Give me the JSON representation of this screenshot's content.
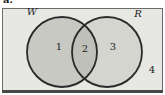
{
  "figure": {
    "list_marker": "a.",
    "venn": {
      "left_set_label": "W",
      "right_set_label": "R",
      "regions": {
        "left_only": "1",
        "intersection": "2",
        "right_only": "3",
        "outside": "4"
      }
    },
    "colors": {
      "frame_fill": "#e7e7e3",
      "frame_border": "#6b6b6b",
      "frame_border_bottom": "#474747",
      "left_circle_fill": "#c9c9c4",
      "right_circle_fill": "#d5d5cf",
      "intersection_fill": "#c0c0ba",
      "circle_stroke": "#2a2a2a",
      "text_color": "#222222"
    }
  }
}
